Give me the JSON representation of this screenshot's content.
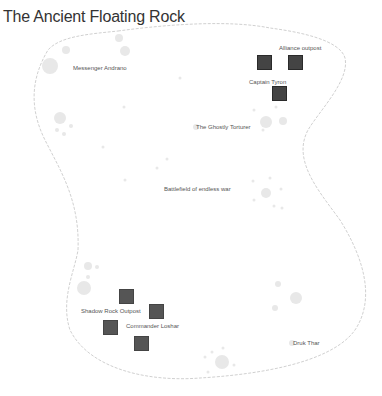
{
  "map": {
    "title": "The Ancient Floating Rock",
    "colors": {
      "border": "#bbbbbb",
      "marker": "#444444",
      "blob": "#e6e6e6",
      "label": "#555555"
    },
    "locations": [
      {
        "name": "Messenger Andrano",
        "x": 73,
        "y": 65
      },
      {
        "name": "Alliance outpost",
        "x": 279,
        "y": 45
      },
      {
        "name": "Captain Tyron",
        "x": 249,
        "y": 79
      },
      {
        "name": "The Ghostly Torturer",
        "x": 196,
        "y": 124
      },
      {
        "name": "Battlefield of endless war",
        "x": 164,
        "y": 186
      },
      {
        "name": "Shadow Rock Outpost",
        "x": 81,
        "y": 308
      },
      {
        "name": "Commander Loshar",
        "x": 126,
        "y": 323
      },
      {
        "name": "Druk Thar",
        "x": 293,
        "y": 340
      }
    ],
    "markers": [
      {
        "x": 257,
        "y": 55
      },
      {
        "x": 288,
        "y": 55
      },
      {
        "x": 272,
        "y": 86
      },
      {
        "x": 119,
        "y": 289
      },
      {
        "x": 149,
        "y": 304
      },
      {
        "x": 103,
        "y": 320
      },
      {
        "x": 134,
        "y": 336
      }
    ]
  }
}
